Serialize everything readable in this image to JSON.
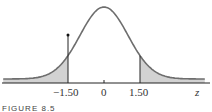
{
  "chart_data": {
    "type": "area",
    "title": "",
    "xlabel": "z",
    "ylabel": "",
    "x_ticks": [
      "-1.50",
      "0",
      "1.50"
    ],
    "distribution": "standard normal",
    "shaded_regions": [
      {
        "from": "-inf",
        "to": -1.5
      },
      {
        "from": 1.5,
        "to": "inf"
      }
    ],
    "markers": [
      {
        "x": -1.5,
        "type": "vertical-line-with-dot"
      },
      {
        "x": 1.5,
        "type": "vertical-line"
      }
    ],
    "xlim": [
      -3.5,
      3.5
    ],
    "grid": false,
    "legend": false,
    "colors": {
      "curve": "#6b6b6b",
      "fill": "#cfcfcf",
      "axis": "#222222"
    }
  },
  "labels": {
    "neg": "−1.50",
    "zero": "0",
    "pos": "1.50",
    "axis": "z",
    "caption": "FIGURE 8.5"
  }
}
